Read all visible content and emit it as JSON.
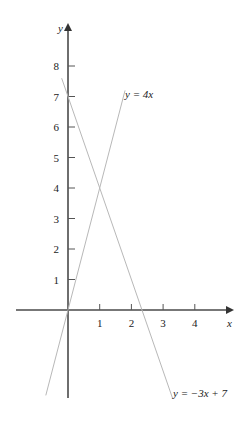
{
  "chart_data": {
    "type": "line",
    "title": "",
    "xlabel": "x",
    "ylabel": "y",
    "xlim": [
      -1.6,
      5.2
    ],
    "ylim": [
      -2.9,
      9.4
    ],
    "grid": false,
    "legend": "none (inline line labels)",
    "x_ticks": [
      1,
      2,
      3,
      4
    ],
    "x_tick_labels": [
      "1",
      "2",
      "3",
      "4"
    ],
    "y_ticks": [
      1,
      2,
      3,
      4,
      5,
      6,
      7,
      8
    ],
    "y_tick_labels": [
      "1",
      "2",
      "3",
      "4",
      "5",
      "6",
      "7",
      "8"
    ],
    "series": [
      {
        "name": "y = 4x",
        "label": "y = 4x",
        "equation": "y = 4x",
        "x": [
          -0.7,
          1.8
        ],
        "y": [
          -2.8,
          7.2
        ]
      },
      {
        "name": "y = -3x + 7",
        "label": "y = −3x + 7",
        "equation": "y = -3x + 7",
        "x": [
          -0.2,
          3.3
        ],
        "y": [
          7.6,
          -2.9
        ]
      }
    ],
    "annotations": [
      {
        "text": "y = 4x",
        "near": [
          1.8,
          7.2
        ]
      },
      {
        "text": "y = −3x + 7",
        "near": [
          3.3,
          -2.9
        ]
      }
    ],
    "intersection": {
      "x": 1,
      "y": 4
    }
  },
  "layout": {
    "origin_px": [
      68,
      310
    ],
    "x_px_per_unit": 31.7,
    "y_px_per_unit": 30.5
  },
  "colors": {
    "axis": "#4a4a4a",
    "function_line": "#b8b8b8",
    "text": "#222222"
  }
}
